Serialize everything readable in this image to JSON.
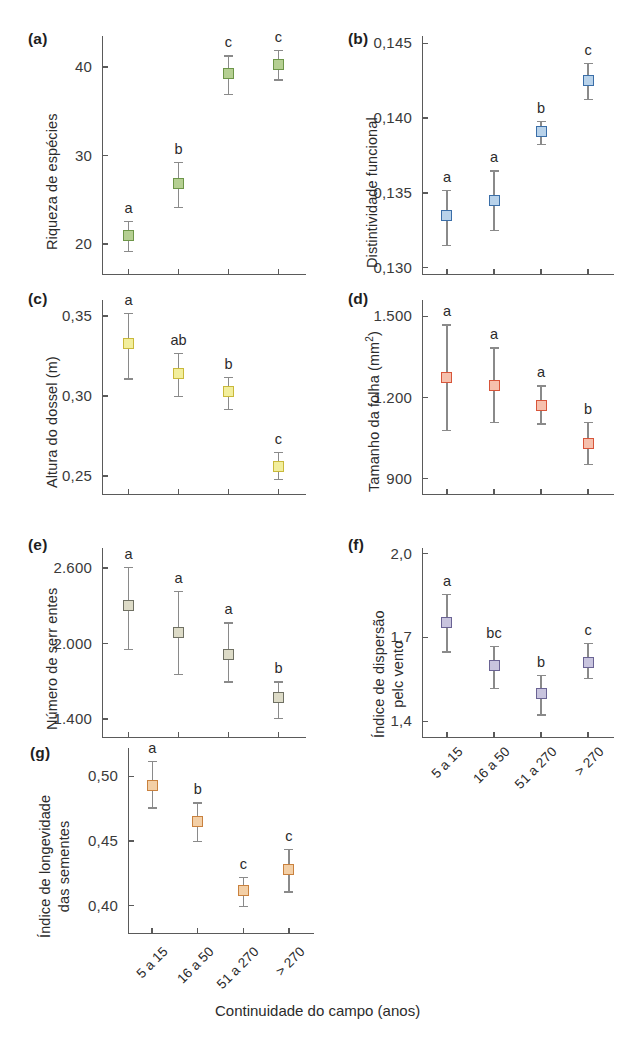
{
  "figure": {
    "x_axis_title": "Continuidade do campo (anos)",
    "categories": [
      "5 a 15",
      "16 a 50",
      "51 a 270",
      "> 270"
    ],
    "panels": [
      {
        "letter": "(a)",
        "ylabel": "Riqueza de espécies",
        "yticks": [
          "40",
          "30",
          "20"
        ],
        "ytick_values": [
          40,
          30,
          20
        ],
        "ylim": [
          16.5,
          43.5
        ],
        "color_fill": "#b5cf92",
        "color_edge": "#6d9648",
        "values": [
          21.0,
          26.8,
          39.3,
          40.3
        ],
        "err_low": [
          19.2,
          24.2,
          37.0,
          38.6
        ],
        "err_high": [
          22.6,
          29.3,
          41.3,
          41.9
        ],
        "sig": [
          "a",
          "b",
          "c",
          "c"
        ]
      },
      {
        "letter": "(b)",
        "ylabel": "Distintividade funcional",
        "yticks": [
          "0,145",
          "0,140",
          "0,135",
          "0,130"
        ],
        "ytick_values": [
          0.145,
          0.14,
          0.135,
          0.13
        ],
        "ylim": [
          0.1295,
          0.1455
        ],
        "color_fill": "#b8d2ea",
        "color_edge": "#3a6ea8",
        "values": [
          0.1335,
          0.1345,
          0.1391,
          0.1425
        ],
        "err_low": [
          0.1315,
          0.1325,
          0.1383,
          0.1413
        ],
        "err_high": [
          0.1352,
          0.1365,
          0.1398,
          0.1437
        ],
        "sig": [
          "a",
          "a",
          "b",
          "c"
        ]
      },
      {
        "letter": "(c)",
        "ylabel": "Altura do dossel (m)",
        "yticks": [
          "0,35",
          "0,30",
          "0,25"
        ],
        "ytick_values": [
          0.35,
          0.3,
          0.25
        ],
        "ylim": [
          0.238,
          0.36
        ],
        "color_fill": "#f2ee9c",
        "color_edge": "#c9b93a",
        "values": [
          0.333,
          0.314,
          0.303,
          0.256
        ],
        "err_low": [
          0.311,
          0.3,
          0.292,
          0.248
        ],
        "err_high": [
          0.352,
          0.327,
          0.312,
          0.265
        ],
        "sig": [
          "a",
          "ab",
          "b",
          "c"
        ]
      },
      {
        "letter": "(d)",
        "ylabel": "Tamanho da folha (mm²)",
        "yticks": [
          "1.500",
          "1.200",
          "900"
        ],
        "ytick_values": [
          1500,
          1200,
          900
        ],
        "ylim": [
          840,
          1560
        ],
        "color_fill": "#f6c0ad",
        "color_edge": "#d8553a",
        "values": [
          1275,
          1245,
          1170,
          1030
        ],
        "err_low": [
          1080,
          1110,
          1105,
          955
        ],
        "err_high": [
          1470,
          1385,
          1245,
          1110
        ],
        "sig": [
          "a",
          "a",
          "a",
          "b"
        ]
      },
      {
        "letter": "(e)",
        "ylabel": "Número de serr entes",
        "yticks": [
          "2.600",
          "2.000",
          "1.400"
        ],
        "ytick_values": [
          2600,
          2000,
          1400
        ],
        "ylim": [
          1250,
          2760
        ],
        "color_fill": "#dddbc7",
        "color_edge": "#6f7063",
        "values": [
          2300,
          2090,
          1910,
          1570
        ],
        "err_low": [
          1960,
          1760,
          1700,
          1410
        ],
        "err_high": [
          2610,
          2420,
          2170,
          1700
        ],
        "sig": [
          "a",
          "a",
          "a",
          "b"
        ]
      },
      {
        "letter": "(f)",
        "ylabel": "Índice de dispersão\npelc vento",
        "yticks": [
          "2,0",
          "1,7",
          "1,4"
        ],
        "ytick_values": [
          2.0,
          1.7,
          1.4
        ],
        "ylim": [
          1.34,
          2.02
        ],
        "color_fill": "#c8c4de",
        "color_edge": "#6a6394",
        "values": [
          1.755,
          1.6,
          1.5,
          1.61
        ],
        "err_low": [
          1.65,
          1.52,
          1.425,
          1.555
        ],
        "err_high": [
          1.855,
          1.67,
          1.565,
          1.68
        ],
        "sig": [
          "a",
          "bc",
          "b",
          "c"
        ]
      },
      {
        "letter": "(g)",
        "ylabel": "Índice de longevidade\ndas sementes",
        "yticks": [
          "0,50",
          "0,45",
          "0,40"
        ],
        "ytick_values": [
          0.5,
          0.45,
          0.4
        ],
        "ylim": [
          0.378,
          0.522
        ],
        "color_fill": "#f3cfa6",
        "color_edge": "#c9813e",
        "values": [
          0.493,
          0.465,
          0.412,
          0.428
        ],
        "err_low": [
          0.476,
          0.45,
          0.4,
          0.411
        ],
        "err_high": [
          0.512,
          0.48,
          0.422,
          0.444
        ],
        "sig": [
          "a",
          "b",
          "c",
          "c"
        ]
      }
    ]
  }
}
